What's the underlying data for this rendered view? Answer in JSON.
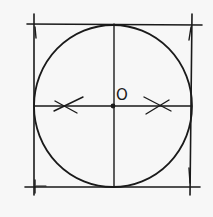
{
  "diagram": {
    "colors": {
      "background": "#f7f7f7",
      "ink": "#1a1a1a"
    },
    "square": {
      "top_y": 24,
      "bottom_y": 187,
      "left_x": 34,
      "right_x": 191
    },
    "circle": {
      "cx": 113,
      "cy": 106,
      "rx": 79,
      "ry": 81
    },
    "center": {
      "label": "O",
      "x": 113,
      "y": 106
    },
    "diameters": [
      "horizontal",
      "vertical"
    ],
    "construction_marks": [
      "left-arc-cross",
      "right-arc-cross"
    ]
  }
}
